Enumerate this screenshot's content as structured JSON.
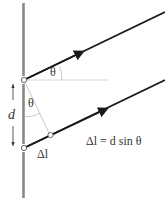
{
  "diagram": {
    "labels": {
      "theta_upper": "θ",
      "theta_lower": "θ",
      "slit_separation": "d",
      "path_difference": "Δl",
      "equation": "Δl = d sin θ"
    },
    "colors": {
      "barrier": "#8a8a8a",
      "ray": "#1a1a1a",
      "guide": "#bbbbbb",
      "text": "#333333"
    }
  }
}
